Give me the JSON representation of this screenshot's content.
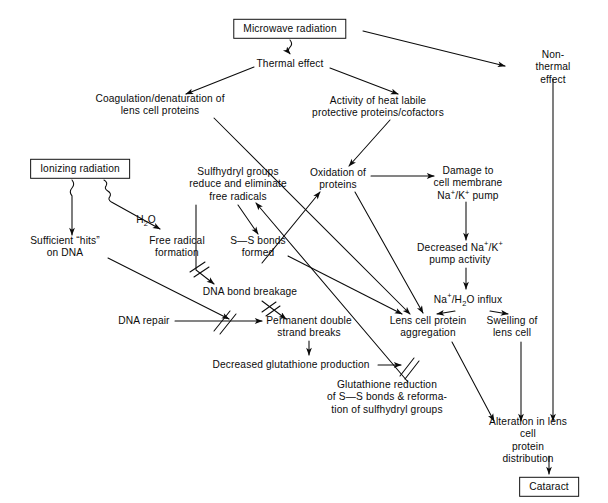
{
  "figure": {
    "type": "flowchart",
    "width": 608,
    "height": 503,
    "background": "#ffffff",
    "ink": "#0b0b0b"
  },
  "nodes": [
    {
      "id": "microwave",
      "label": "Microwave radiation",
      "style": "boxed",
      "x": 290,
      "y": 29
    },
    {
      "id": "thermal",
      "label": "Thermal effect",
      "style": "plain",
      "x": 290,
      "y": 64
    },
    {
      "id": "nonthermal",
      "label": "Non-thermal effect",
      "style": "plain",
      "x": 553,
      "y": 68
    },
    {
      "id": "coagulation",
      "label": "Coagulation/denaturation of\nlens cell proteins",
      "style": "plain",
      "x": 160,
      "y": 105
    },
    {
      "id": "heatlabile",
      "label": "Activity of heat labile\nprotective proteins/cofactors",
      "style": "plain",
      "x": 378,
      "y": 107
    },
    {
      "id": "ionizing",
      "label": "Ionizing radiation",
      "style": "boxed",
      "x": 80,
      "y": 169
    },
    {
      "id": "sulfhydryl",
      "label": "Sulfhydryl groups\nreduce and eliminate\nfree radicals",
      "style": "plain",
      "x": 238,
      "y": 185
    },
    {
      "id": "oxidation",
      "label": "Oxidation of\nproteins",
      "style": "plain",
      "x": 338,
      "y": 179
    },
    {
      "id": "damage_membrane",
      "label": "Damage to\ncell membrane\nNaK pump",
      "style": "plain",
      "x": 468,
      "y": 184
    },
    {
      "id": "hits_dna",
      "label": "Sufficient “hits”\non DNA",
      "style": "plain",
      "x": 65,
      "y": 247
    },
    {
      "id": "free_radical",
      "label": "Free radical\nformation",
      "style": "plain",
      "x": 177,
      "y": 247
    },
    {
      "id": "ss_bonds",
      "label": "S—S bonds\nformed",
      "style": "plain",
      "x": 258,
      "y": 247
    },
    {
      "id": "decreased_pump",
      "label": "Decreased NaK\npump activity",
      "style": "plain",
      "x": 460,
      "y": 254
    },
    {
      "id": "dna_breakage",
      "label": "DNA bond breakage",
      "style": "plain",
      "x": 250,
      "y": 292
    },
    {
      "id": "influx",
      "label": "NaHO influx",
      "style": "plain",
      "x": 468,
      "y": 300
    },
    {
      "id": "dna_repair",
      "label": "DNA repair",
      "style": "plain",
      "x": 144,
      "y": 321
    },
    {
      "id": "permanent",
      "label": "Permanent double\nstrand breaks",
      "style": "plain",
      "x": 309,
      "y": 327
    },
    {
      "id": "aggregation",
      "label": "Lens cell protein\naggregation",
      "style": "plain",
      "x": 428,
      "y": 327
    },
    {
      "id": "swelling",
      "label": "Swelling of\nlens cell",
      "style": "plain",
      "x": 512,
      "y": 327
    },
    {
      "id": "decr_glut",
      "label": "Decreased glutathione production",
      "style": "plain",
      "x": 291,
      "y": 365
    },
    {
      "id": "glut_reduction",
      "label": "Glutathione reduction\nof S—S bonds & reforma-\ntion of sulfhydryl groups",
      "style": "plain",
      "x": 387,
      "y": 398
    },
    {
      "id": "alteration",
      "label": "Alteration in lens cell\nprotein distribution",
      "style": "plain",
      "x": 528,
      "y": 441
    },
    {
      "id": "cataract",
      "label": "Cataract",
      "style": "boxed",
      "x": 549,
      "y": 487
    }
  ],
  "special_labels": {
    "damage_membrane_line3": {
      "prefix": "Na",
      "sup1": "+",
      "mid": "/K",
      "sup2": "+",
      "suffix": " pump"
    },
    "decreased_pump_line1": {
      "prefix": "Decreased Na",
      "sup1": "+",
      "mid": "/K",
      "sup2": "+"
    },
    "influx_text": {
      "prefix": "Na",
      "sup1": "+",
      "mid": "/H",
      "sub1": "2",
      "suffix": "O influx"
    },
    "h2o_label": {
      "prefix": "H",
      "sub1": "2",
      "suffix": "O"
    }
  },
  "edge_labels": [
    {
      "id": "h2o",
      "text": "H2O",
      "x": 146,
      "y": 220
    }
  ],
  "edges": [
    {
      "from": "microwave",
      "to": "thermal",
      "kind": "squiggle"
    },
    {
      "from": "microwave",
      "to": "nonthermal",
      "kind": "arrow"
    },
    {
      "from": "thermal",
      "to": "coagulation",
      "kind": "arrow"
    },
    {
      "from": "thermal",
      "to": "heatlabile",
      "kind": "arrow"
    },
    {
      "from": "heatlabile",
      "to": "oxidation",
      "kind": "arrow"
    },
    {
      "from": "oxidation",
      "to": "damage_membrane",
      "kind": "arrow"
    },
    {
      "from": "damage_membrane",
      "to": "decreased_pump",
      "kind": "arrow"
    },
    {
      "from": "decreased_pump",
      "to": "influx",
      "kind": "arrow"
    },
    {
      "from": "influx",
      "to": "swelling",
      "kind": "arrow"
    },
    {
      "from": "influx",
      "to": "aggregation",
      "kind": "arrow"
    },
    {
      "from": "coagulation",
      "to": "aggregation",
      "kind": "arrow"
    },
    {
      "from": "oxidation",
      "to": "aggregation",
      "kind": "arrow"
    },
    {
      "from": "ionizing",
      "to": "hits_dna",
      "kind": "squiggle"
    },
    {
      "from": "ionizing",
      "to": "free_radical",
      "kind": "squiggle",
      "label": "H2O"
    },
    {
      "from": "free_radical",
      "to": "oxidation",
      "kind": "arrow"
    },
    {
      "from": "sulfhydryl",
      "to": "ss_bonds",
      "kind": "arrow"
    },
    {
      "from": "sulfhydryl",
      "to": "dna_breakage",
      "kind": "arrow",
      "inhibited": true
    },
    {
      "from": "hits_dna",
      "to": "permanent",
      "kind": "arrow"
    },
    {
      "from": "dna_repair",
      "to": "permanent",
      "kind": "arrow",
      "inhibited": true
    },
    {
      "from": "dna_breakage",
      "to": "permanent",
      "kind": "arrow",
      "inhibited": true
    },
    {
      "from": "permanent",
      "to": "decr_glut",
      "kind": "arrow"
    },
    {
      "from": "decr_glut",
      "to": "glut_reduction",
      "kind": "arrow",
      "inhibited": true
    },
    {
      "from": "glut_reduction",
      "to": "sulfhydryl",
      "kind": "arrow"
    },
    {
      "from": "ss_bonds",
      "to": "aggregation",
      "kind": "arrow"
    },
    {
      "from": "aggregation",
      "to": "alteration",
      "kind": "arrow"
    },
    {
      "from": "swelling",
      "to": "alteration",
      "kind": "arrow"
    },
    {
      "from": "nonthermal",
      "to": "alteration",
      "kind": "arrow"
    },
    {
      "from": "alteration",
      "to": "cataract",
      "kind": "arrow"
    }
  ]
}
